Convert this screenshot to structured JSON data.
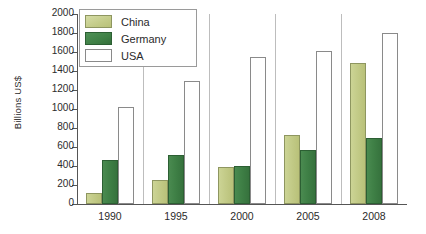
{
  "chart_data": {
    "type": "bar",
    "title": "",
    "xlabel": "",
    "ylabel": "Billions US$",
    "categories": [
      "1990",
      "1995",
      "2000",
      "2005",
      "2008"
    ],
    "series": [
      {
        "name": "China",
        "color": "#c3cb88",
        "values": [
          120,
          250,
          390,
          730,
          1485
        ]
      },
      {
        "name": "Germany",
        "color": "#3f8046",
        "values": [
          460,
          520,
          395,
          570,
          700
        ]
      },
      {
        "name": "USA",
        "color": "#ffffff",
        "values": [
          1020,
          1300,
          1545,
          1610,
          1805
        ]
      }
    ],
    "ylim": [
      0,
      2000
    ],
    "ytick_values": [
      0,
      200,
      400,
      600,
      800,
      1000,
      1200,
      1400,
      1600,
      1800,
      2000
    ],
    "ytick_labels": [
      "0",
      "200",
      "400",
      "600",
      "800",
      "1000",
      "1200",
      "1400",
      "1600",
      "1800",
      "2000"
    ],
    "grid": false,
    "legend_position": "top-left",
    "legend_entries": [
      "China",
      "Germany",
      "USA"
    ]
  }
}
